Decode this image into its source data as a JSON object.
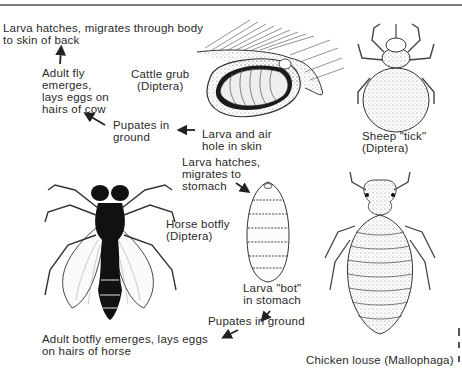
{
  "figure": {
    "labels": {
      "cattle_step1": "Larva hatches, migrates through body\nto skin of back",
      "cattle_step2": "Adult fly\nemerges,\nlays eggs on\nhairs of cow",
      "cattle_name": "Cattle grub\n(Diptera)",
      "cattle_step3": "Pupates in\nground",
      "cattle_step4": "Larva and air\nhole in skin",
      "sheep_name": "Sheep \"tick\"\n(Diptera)",
      "horse_step1": "Larva hatches,\nmigrates to\nstomach",
      "horse_name": "Horse botfly\n(Diptera)",
      "horse_step2": "Larva \"bot\"\nin stomach",
      "horse_step3": "Pupates in ground",
      "horse_step4": "Adult botfly emerges, lays eggs\non hairs of horse",
      "louse_name": "Chicken louse (Mallophaga)"
    },
    "illustrations": [
      "cattle-grub-in-skin",
      "sheep-ked",
      "horse-botfly-adult",
      "horse-bot-larva",
      "chicken-louse"
    ],
    "colors": {
      "ink": "#2a2a2a",
      "rule": "#7a7a7a",
      "background": "#ffffff"
    }
  }
}
